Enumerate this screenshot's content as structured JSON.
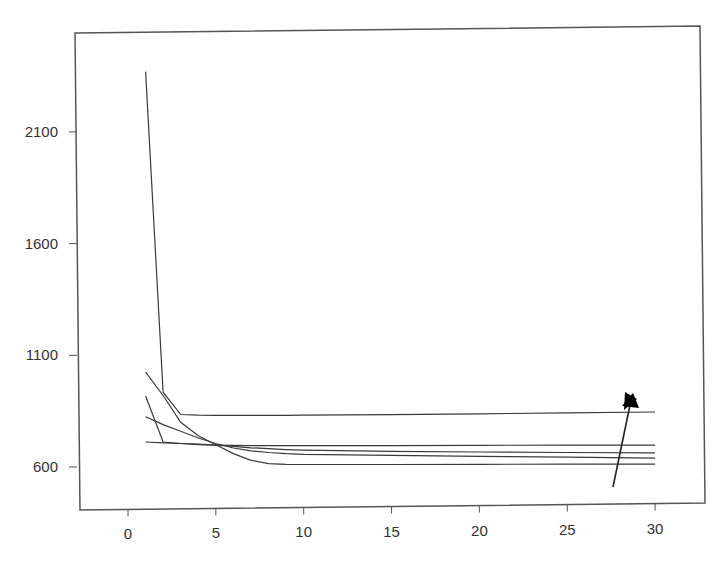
{
  "chart_data": {
    "type": "line",
    "title": "",
    "xlabel": "",
    "ylabel": "",
    "x_ticks": [
      "0",
      "5",
      "10",
      "15",
      "20",
      "25",
      "30"
    ],
    "y_ticks": [
      "600",
      "1100",
      "1600",
      "2100"
    ],
    "y_tick_labels_visible": [
      "600",
      "1100",
      "1600",
      "2100"
    ],
    "xlim": [
      -3,
      31
    ],
    "ylim": [
      430,
      2520
    ],
    "grid": false,
    "legend": null,
    "x": [
      1,
      2,
      3,
      4,
      5,
      6,
      7,
      8,
      9,
      10,
      15,
      20,
      25,
      30
    ],
    "series": [
      {
        "name": "series-1",
        "values": [
          2370,
          935,
          835,
          832,
          831,
          831,
          831,
          831,
          831,
          832,
          834,
          838,
          842,
          846
        ]
      },
      {
        "name": "series-2",
        "values": [
          1025,
          920,
          800,
          740,
          700,
          660,
          630,
          615,
          612,
          611,
          611,
          612,
          613,
          613
        ]
      },
      {
        "name": "series-3",
        "values": [
          918,
          712,
          705,
          700,
          698,
          697,
          696,
          696,
          696,
          696,
          696,
          697,
          698,
          698
        ]
      },
      {
        "name": "series-4",
        "values": [
          825,
          790,
          760,
          730,
          705,
          685,
          672,
          665,
          660,
          657,
          652,
          648,
          644,
          640
        ]
      },
      {
        "name": "series-5",
        "values": [
          712,
          708,
          705,
          702,
          698,
          692,
          686,
          682,
          678,
          675,
          670,
          667,
          665,
          663
        ]
      }
    ],
    "annotations": [
      {
        "type": "arrow",
        "from": [
          27.8,
          540
        ],
        "to": [
          29.2,
          850
        ],
        "meaning": "increasing trend"
      }
    ]
  },
  "axes": {
    "x_tick_labels": [
      "0",
      "5",
      "10",
      "15",
      "20",
      "25",
      "30"
    ],
    "y_tick_labels": [
      "2100",
      "1600",
      "1100",
      "600"
    ]
  }
}
